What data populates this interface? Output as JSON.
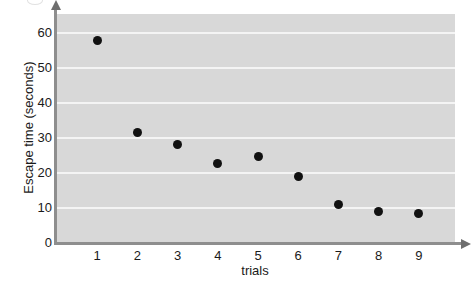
{
  "chart_data": {
    "type": "scatter",
    "title": "",
    "xlabel": "trials",
    "ylabel": "Escape time (seconds)",
    "x": [
      1,
      2,
      3,
      4,
      5,
      6,
      7,
      8,
      9
    ],
    "values": [
      57.5,
      31.2,
      27.8,
      22.4,
      24.5,
      18.7,
      10.8,
      8.6,
      8.0
    ],
    "xticklabels": [
      "1",
      "2",
      "3",
      "4",
      "5",
      "6",
      "7",
      "8",
      "9"
    ],
    "yticklabels": [
      "0",
      "10",
      "20",
      "30",
      "40",
      "50",
      "60"
    ],
    "yticks": [
      0,
      10,
      20,
      30,
      40,
      50,
      60
    ],
    "ylim": [
      0,
      65
    ],
    "xlim": [
      0,
      9.9
    ],
    "grid": "horizontal",
    "legend": "none",
    "marker": "filled-circle",
    "marker_color": "#111111",
    "plot_background": "#d8d8d8",
    "gridline_color": "#f4f4f4",
    "axis_color": "#8e8e8e"
  }
}
